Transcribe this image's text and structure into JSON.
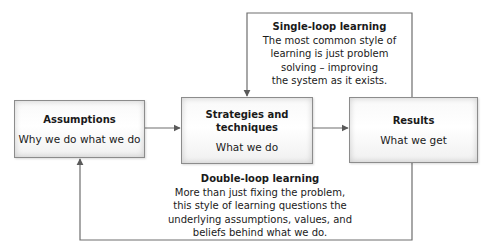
{
  "boxes": {
    "assumptions": {
      "title": "Assumptions",
      "subtitle": "Why we do what we do"
    },
    "strategies": {
      "title_line1": "Strategies and",
      "title_line2": "techniques",
      "subtitle": "What we do"
    },
    "results": {
      "title": "Results",
      "subtitle": "What we get"
    }
  },
  "single_loop": {
    "title": "Single-loop learning",
    "lines": [
      "The most common style of",
      "learning is just problem",
      "solving – improving",
      "the system as it exists."
    ]
  },
  "double_loop": {
    "title": "Double-loop learning",
    "lines": [
      "More than just fixing the problem,",
      "this style of learning questions the",
      "underlying assumptions, values, and",
      "beliefs behind what we do."
    ]
  },
  "colors": {
    "line": "#6e6e6e",
    "box_border": "#8c8c8c",
    "text": "#1a1a1a"
  }
}
